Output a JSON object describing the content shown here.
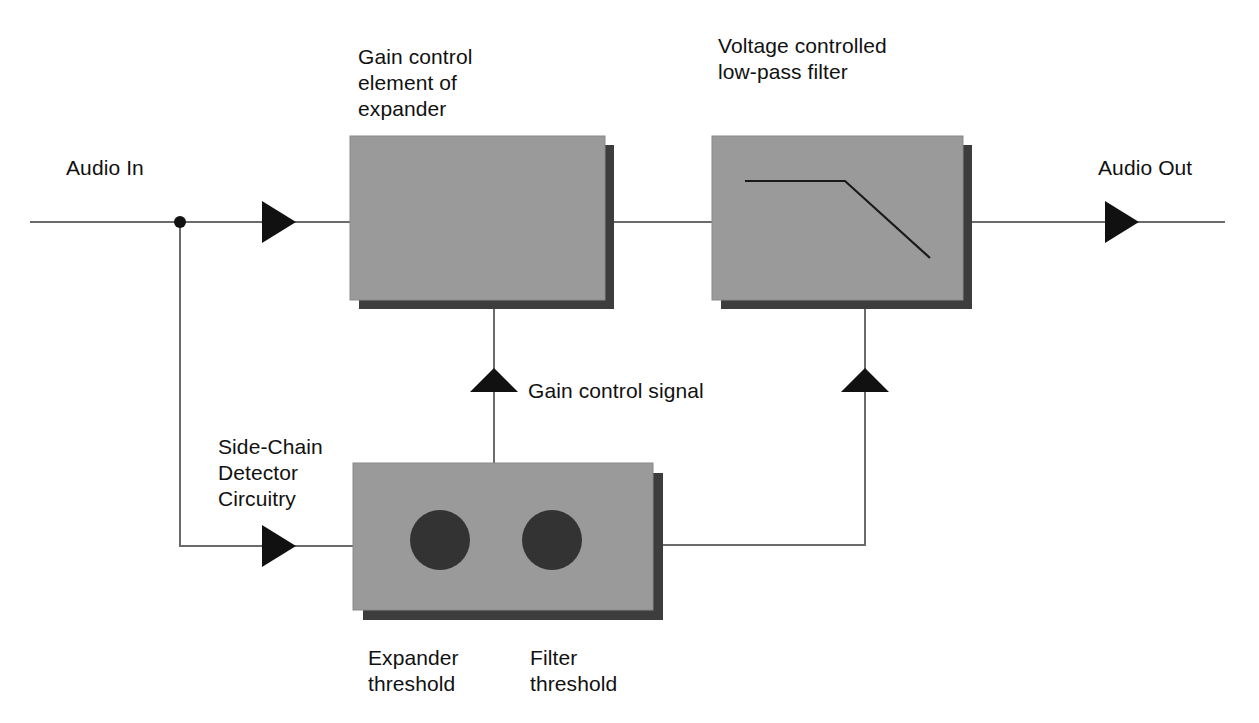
{
  "diagram": {
    "background_color": "#ffffff",
    "block_fill": "#9a9a9a",
    "block_shadow": "#3d3d3d",
    "knob_color": "#333333",
    "line_color": "#6b6b6b",
    "arrow_color": "#111111",
    "text_color": "#111111"
  },
  "labels": {
    "audio_in": "Audio In",
    "audio_out": "Audio Out",
    "gain_control_block_line1": "Gain control",
    "gain_control_block_line2": "element of",
    "gain_control_block_line3": "expander",
    "filter_block_line1": "Voltage controlled",
    "filter_block_line2": "low-pass filter",
    "side_chain_line1": "Side-Chain",
    "side_chain_line2": "Detector",
    "side_chain_line3": "Circuitry",
    "gain_control_signal": "Gain control signal",
    "expander_threshold_line1": "Expander",
    "expander_threshold_line2": "threshold",
    "filter_threshold_line1": "Filter",
    "filter_threshold_line2": "threshold"
  },
  "blocks": [
    {
      "name": "gain-control-element-block",
      "x": 350,
      "y": 136,
      "width": 255,
      "height": 164,
      "shadow_offset": 9,
      "contents": "none"
    },
    {
      "name": "voltage-controlled-filter-block",
      "x": 712,
      "y": 136,
      "width": 251,
      "height": 164,
      "shadow_offset": 9,
      "contents": "lowpass-response-curve"
    },
    {
      "name": "side-chain-detector-block",
      "x": 353,
      "y": 463,
      "width": 300,
      "height": 147,
      "shadow_offset": 10,
      "contents": "two-threshold-knobs"
    }
  ],
  "knobs": [
    {
      "name": "expander-threshold-knob",
      "cx": 440,
      "cy": 540,
      "r": 30
    },
    {
      "name": "filter-threshold-knob",
      "cx": 552,
      "cy": 540,
      "r": 30
    }
  ],
  "filter_curve": {
    "name": "lowpass-response-curve",
    "points": "745,181 845,181 930,258"
  },
  "signal_path": {
    "main_line_y": 222,
    "junction_dot": {
      "cx": 180,
      "cy": 222,
      "r": 6
    },
    "input_start_x": 30,
    "output_end_x": 1225,
    "branch_down_x": 180,
    "branch_down_to_y": 546,
    "side_chain_in_y": 546,
    "gain_control_line_x": 494,
    "gain_control_line_top_y": 300,
    "filter_control_line_x": 865,
    "filter_control_line_top_y": 300,
    "filter_control_line_bottom_y": 545
  },
  "arrows": [
    {
      "name": "audio-in-arrow",
      "x": 262,
      "y": 222,
      "direction": "right"
    },
    {
      "name": "audio-out-arrow",
      "x": 1105,
      "y": 222,
      "direction": "right"
    },
    {
      "name": "side-chain-input-arrow",
      "x": 262,
      "y": 546,
      "direction": "right"
    },
    {
      "name": "gain-control-arrow",
      "x": 494,
      "y": 382,
      "direction": "up"
    },
    {
      "name": "filter-control-arrow",
      "x": 865,
      "y": 382,
      "direction": "up"
    }
  ]
}
